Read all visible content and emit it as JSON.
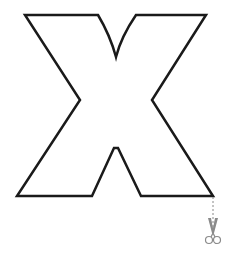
{
  "figure": {
    "letter": "X",
    "outline_color": "#1a1a1a",
    "fill_color": "#ffffff",
    "cut_line_color": "#888888",
    "scissors_color": "#8a8a8a"
  },
  "icons": {
    "scissors": "scissors-icon"
  }
}
